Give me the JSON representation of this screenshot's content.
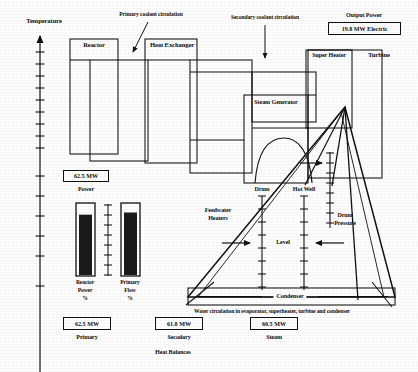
{
  "figure": {
    "axis_label": "Temperature",
    "caption": "Water circulation in evaporator, superheater, turbine and condenser"
  },
  "annotations": {
    "primary_circulation": "Primary coolant circulation",
    "secondary_circulation": "Secondary coolant circulation",
    "output_power_title": "Output Power"
  },
  "components": {
    "reactor": "Reactor",
    "heat_exchanger": "Heat Exchanger",
    "steam_generator": "Steam Generator",
    "super_heater": "Super Heater",
    "turbine": "Turbine",
    "condenser": "Condenser",
    "feedwater_heaters_line1": "Feedwater",
    "feedwater_heaters_line2": "Heaters"
  },
  "readouts": {
    "output_power_value": "19.8 MW  Electric",
    "reactor_power_value": "62.5 MW",
    "reactor_power_caption": "Power",
    "primary_balance_value": "62.5 MW",
    "primary_balance_caption": "Primary",
    "secondary_balance_value": "61.8 MW",
    "secondary_balance_caption": "Secodary",
    "steam_balance_value": "60.5 MW",
    "steam_balance_caption": "Steam",
    "heat_balances_caption": "Heat Balances"
  },
  "gauges": [
    {
      "name": "reactor-power",
      "label_line1": "Reactor",
      "label_line2": "Power",
      "label_line3": "%",
      "fill_percent": 85
    },
    {
      "name": "primary-flow",
      "label_line1": "Primary",
      "label_line2": "Flow",
      "label_line3": "%",
      "fill_percent": 88
    }
  ],
  "scales": {
    "drum": "Drum",
    "hot_well": "Hot Well",
    "level": "Level",
    "drum_pressure_line1": "Drum",
    "drum_pressure_line2": "Pressure"
  },
  "colors": {
    "ink": "#111111",
    "paper": "#ffffff",
    "fill": "#1a1a1a"
  },
  "chart_data": {
    "type": "diagram",
    "ylabel": "Temperature",
    "axis_ticks": 14,
    "gauge_values": [
      85,
      88
    ],
    "power_values_mw": [
      19.8,
      62.5,
      62.5,
      61.8,
      60.5
    ]
  }
}
